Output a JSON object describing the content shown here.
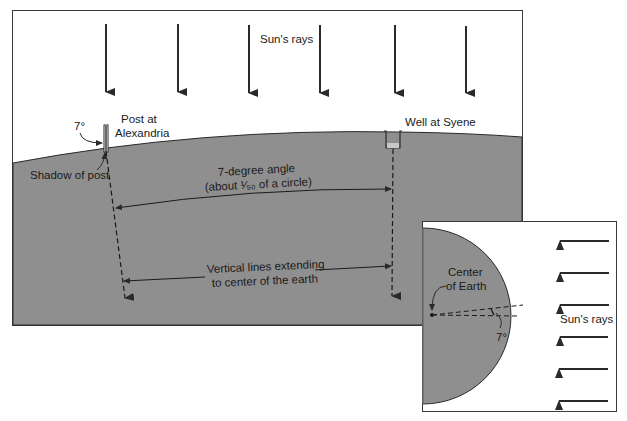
{
  "main_panel": {
    "sun_rays_label": "Sun's rays",
    "post_label_line1": "Post at",
    "post_label_line2": "Alexandria",
    "angle_label": "7°",
    "shadow_label": "Shadow of post",
    "well_label": "Well at Syene",
    "angle_caption_line1": "7-degree angle",
    "angle_caption_line2": "(about ¹⁄₅₀ of a circle)",
    "vertical_caption_line1": "Vertical lines extending",
    "vertical_caption_line2": "to center of the earth",
    "ray_count": 6
  },
  "inset_panel": {
    "center_label_line1": "Center",
    "center_label_line2": "of Earth",
    "angle_label": "7°",
    "sun_rays_label": "Sun's rays",
    "ray_count": 6
  },
  "colors": {
    "earth_fill": "#8f8f8f",
    "line": "#2a2a2a",
    "sky": "#ffffff"
  }
}
